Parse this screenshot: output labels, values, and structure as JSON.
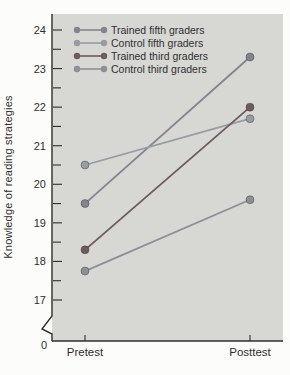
{
  "figure": {
    "y_axis_label": "Knowledge of reading strategies",
    "origin_label": "0"
  },
  "chart_data": {
    "type": "line",
    "title": "",
    "xlabel": "",
    "ylabel": "Knowledge of reading strategies",
    "categories": [
      "Pretest",
      "Posttest"
    ],
    "series": [
      {
        "name": "Trained fifth graders",
        "values": [
          19.5,
          23.3
        ],
        "color": "#82858e"
      },
      {
        "name": "Control fifth graders",
        "values": [
          20.5,
          21.7
        ],
        "color": "#979ba2"
      },
      {
        "name": "Trained third graders",
        "values": [
          18.3,
          22.0
        ],
        "color": "#6f5a5e"
      },
      {
        "name": "Control third graders",
        "values": [
          17.75,
          19.6
        ],
        "color": "#8c8f96"
      }
    ],
    "y_ticks": [
      17,
      18,
      19,
      20,
      21,
      22,
      23,
      24
    ],
    "minor_tick_step": 0.5,
    "ylim": [
      17,
      24
    ],
    "axis_break": true,
    "grid": false,
    "legend_position": "top-left",
    "plot_bg": "#d7d7d4",
    "axis_color": "#2e2e2e",
    "text_color": "#2f2f2f"
  }
}
